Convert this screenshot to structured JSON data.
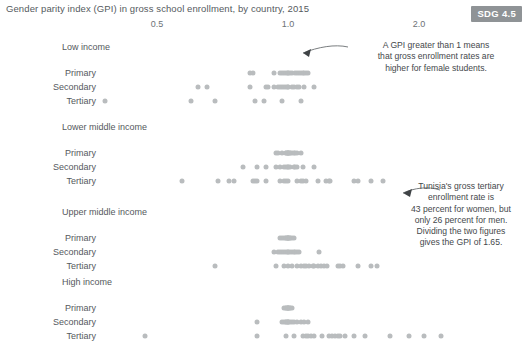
{
  "header": {
    "title": "Gender parity index (GPI) in gross school enrollment, by country, 2015",
    "badge": "SDG 4.5"
  },
  "annotations": [
    {
      "id": "gpi-note",
      "text": "A GPI greater than 1 means\nthat gross enrollment rates are\nhigher for female students."
    },
    {
      "id": "tunisia-note",
      "text": "Tunisia's gross tertiary\nenrollment rate is\n43 percent for women, but\nonly 26 percent for men.\nDividing the two figures\ngives the GPI of 1.65."
    }
  ],
  "colors": {
    "dot": "#b9bcbe",
    "text": "#55595d",
    "badge_bg": "#8f9396",
    "badge_fg": "#ffffff",
    "background": "#ffffff"
  },
  "chart_data": {
    "type": "scatter",
    "title": "Gender parity index (GPI) in gross school enrollment, by country, 2015",
    "xlabel": "",
    "ylabel": "",
    "scale": "log",
    "xlim": [
      0.33,
      2.6
    ],
    "grid": false,
    "legend": null,
    "xticks": [
      0.5,
      1.0,
      2.0
    ],
    "xticklabels": [
      "0.5",
      "1.0",
      "2.0"
    ],
    "groups": [
      {
        "name": "Low income",
        "rows": [
          {
            "label": "Primary",
            "values": [
              0.82,
              0.83,
              0.93,
              0.96,
              0.97,
              0.98,
              0.99,
              1.0,
              1.0,
              1.01,
              1.02,
              1.04,
              1.05,
              1.06,
              1.07,
              1.08,
              1.09,
              1.1,
              1.11
            ]
          },
          {
            "label": "Secondary",
            "values": [
              0.62,
              0.65,
              0.82,
              0.89,
              0.9,
              0.93,
              0.95,
              0.96,
              0.97,
              0.98,
              0.99,
              1.0,
              1.0,
              1.02,
              1.03,
              1.05,
              1.06,
              1.09,
              1.15
            ]
          },
          {
            "label": "Tertiary",
            "values": [
              0.38,
              0.6,
              0.68,
              0.84,
              0.88,
              0.97,
              1.07
            ]
          }
        ]
      },
      {
        "name": "Lower middle income",
        "rows": [
          {
            "label": "Primary",
            "values": [
              0.94,
              0.95,
              0.97,
              0.99,
              0.99,
              1.0,
              1.0,
              1.0,
              1.0,
              1.01,
              1.01,
              1.02,
              1.03,
              1.04,
              1.05,
              1.07
            ]
          },
          {
            "label": "Secondary",
            "values": [
              0.79,
              0.85,
              0.89,
              0.94,
              0.96,
              0.98,
              0.99,
              1.0,
              1.0,
              1.01,
              1.03,
              1.04,
              1.05,
              1.08,
              1.15
            ]
          },
          {
            "label": "Tertiary",
            "values": [
              0.57,
              0.69,
              0.73,
              0.75,
              0.83,
              0.84,
              0.85,
              0.89,
              0.96,
              0.98,
              0.99,
              1.0,
              1.05,
              1.07,
              1.08,
              1.1,
              1.17,
              1.22,
              1.24,
              1.25,
              1.42,
              1.45,
              1.55,
              1.65
            ]
          }
        ]
      },
      {
        "name": "Upper middle income",
        "rows": [
          {
            "label": "Primary",
            "values": [
              0.96,
              0.97,
              0.98,
              0.99,
              0.99,
              1.0,
              1.0,
              1.0,
              1.0,
              1.01,
              1.01,
              1.02,
              1.03
            ]
          },
          {
            "label": "Secondary",
            "values": [
              0.93,
              0.95,
              0.96,
              0.97,
              0.98,
              0.99,
              1.0,
              1.0,
              1.01,
              1.02,
              1.03,
              1.04,
              1.05,
              1.06,
              1.18
            ]
          },
          {
            "label": "Tertiary",
            "values": [
              0.68,
              0.94,
              0.98,
              1.0,
              1.02,
              1.05,
              1.07,
              1.09,
              1.1,
              1.12,
              1.14,
              1.15,
              1.17,
              1.19,
              1.21,
              1.23,
              1.3,
              1.32,
              1.34,
              1.45,
              1.55,
              1.6
            ]
          }
        ]
      },
      {
        "name": "High income",
        "rows": [
          {
            "label": "Primary",
            "values": [
              0.98,
              0.99,
              0.99,
              1.0,
              1.0,
              1.0,
              1.0,
              1.01,
              1.01,
              1.02
            ]
          },
          {
            "label": "Secondary",
            "values": [
              0.85,
              0.97,
              0.98,
              0.99,
              0.99,
              1.0,
              1.0,
              1.0,
              1.01,
              1.02,
              1.03,
              1.05,
              1.07,
              1.09,
              1.11
            ]
          },
          {
            "label": "Tertiary",
            "values": [
              0.47,
              0.85,
              0.99,
              1.03,
              1.08,
              1.1,
              1.11,
              1.13,
              1.15,
              1.2,
              1.24,
              1.26,
              1.28,
              1.3,
              1.32,
              1.35,
              1.42,
              1.5,
              1.72,
              1.9,
              2.05,
              2.25
            ]
          }
        ]
      }
    ]
  }
}
